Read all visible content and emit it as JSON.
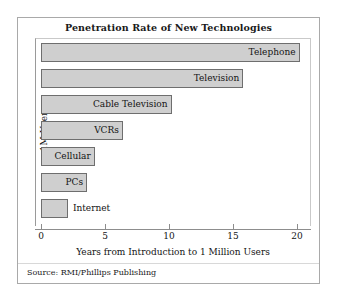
{
  "figure": {
    "title": "Penetration Rate of New Technologies",
    "source_note": "Source: RMI/Phillips Publishing"
  },
  "chart_data": {
    "type": "bar",
    "orientation": "horizontal",
    "title": "Penetration Rate of New Technologies",
    "xlabel": "Years from Introduction to 1 Million Users",
    "ylabel": "1M Users",
    "xlim": [
      0,
      21.5
    ],
    "xticks": [
      0,
      5,
      10,
      15,
      20
    ],
    "xtick_labels": [
      "0",
      "5",
      "10",
      "15",
      "20"
    ],
    "grid": false,
    "legend": false,
    "categories": [
      "Telephone",
      "Television",
      "Cable Television",
      "VCRs",
      "Cellular",
      "PCs",
      "Internet"
    ],
    "values": [
      20.2,
      15.8,
      10.2,
      6.4,
      4.2,
      3.6,
      2.1
    ],
    "bars": [
      {
        "label": "Telephone",
        "value": 20.2,
        "label_position": "inside"
      },
      {
        "label": "Television",
        "value": 15.8,
        "label_position": "inside"
      },
      {
        "label": "Cable Television",
        "value": 10.2,
        "label_position": "inside"
      },
      {
        "label": "VCRs",
        "value": 6.4,
        "label_position": "inside"
      },
      {
        "label": "Cellular",
        "value": 4.2,
        "label_position": "inside"
      },
      {
        "label": "PCs",
        "value": 3.6,
        "label_position": "inside"
      },
      {
        "label": "Internet",
        "value": 2.1,
        "label_position": "outside"
      }
    ],
    "colors": {
      "bar_fill": "#cfcfcf",
      "bar_stroke": "#6e6e6e",
      "axis": "#8d8d8d",
      "text": "#141414",
      "frame": "#a9a9a9",
      "background": "#ffffff"
    }
  }
}
